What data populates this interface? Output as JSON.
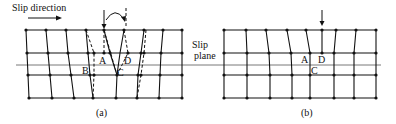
{
  "figure": {
    "slip_direction_label": "Slip direction",
    "slip_plane_label_line1": "Slip",
    "slip_plane_label_line2": "plane",
    "caption_a": "(a)",
    "caption_b": "(b)",
    "panel_a_labels": {
      "A": "A",
      "B": "B",
      "C": "C",
      "D": "D"
    },
    "panel_b_labels": {
      "A": "A",
      "C": "C",
      "D": "D"
    },
    "icons": [
      "arrow-right-icon",
      "arrow-down-icon",
      "curved-arrow-icon"
    ],
    "colors": {
      "lines": "#111111",
      "slip_plane": "#555555",
      "background": "#ffffff"
    }
  }
}
